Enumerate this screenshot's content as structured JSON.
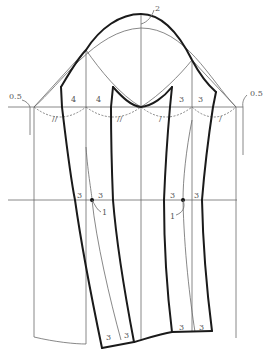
{
  "diagram": {
    "type": "two-piece sleeve pattern draft",
    "colors": {
      "thick_line": "#1a1a1a",
      "thin_line": "#6a6a6a",
      "label": "#555555"
    },
    "labels": {
      "crown_raise": "2",
      "left_ease": "0.5",
      "right_ease": "0.5",
      "front_left_width": "4",
      "front_right_width": "4",
      "back_left_width": "3",
      "back_right_width": "3",
      "elbow_left_a": "3",
      "elbow_left_b": "3",
      "elbow_left_shift": "1",
      "elbow_right_a": "3",
      "elbow_right_b": "3",
      "elbow_right_shift": "1",
      "hem_left_a": "3",
      "hem_left_b": "3",
      "hem_right_a": "3",
      "hem_right_b": "3"
    },
    "marks": {
      "front_arc_marks": "//",
      "back_arc_marks": "/"
    }
  }
}
